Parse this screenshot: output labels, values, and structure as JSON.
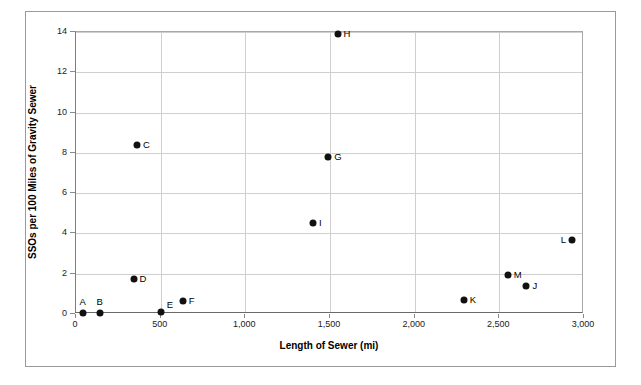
{
  "chart_data": {
    "type": "scatter",
    "title": "",
    "xlabel": "Length of Sewer (mi)",
    "ylabel": "SSOs per 100 Miles of Gravity Sewer",
    "xlim": [
      0,
      3000
    ],
    "ylim": [
      0,
      14
    ],
    "xticks": [
      0,
      500,
      1000,
      1500,
      2000,
      2500,
      3000
    ],
    "xtick_labels": [
      "0",
      "500",
      "1,000",
      "1,500",
      "2,000",
      "2,500",
      "3,000"
    ],
    "yticks": [
      0,
      2,
      4,
      6,
      8,
      10,
      12,
      14
    ],
    "ytick_labels": [
      "0",
      "2",
      "4",
      "6",
      "8",
      "10",
      "12",
      "14"
    ],
    "grid": true,
    "legend": "none",
    "marker": "filled-circle",
    "marker_color": "#111111",
    "grid_color": "#cfcfcf",
    "points": [
      {
        "label": "A",
        "x": 40,
        "y": 0.05,
        "label_pos": "above"
      },
      {
        "label": "B",
        "x": 140,
        "y": 0.05,
        "label_pos": "above"
      },
      {
        "label": "C",
        "x": 360,
        "y": 8.4,
        "label_pos": "right"
      },
      {
        "label": "D",
        "x": 340,
        "y": 1.75,
        "label_pos": "right"
      },
      {
        "label": "E",
        "x": 500,
        "y": 0.1,
        "label_pos": "right-up"
      },
      {
        "label": "F",
        "x": 630,
        "y": 0.65,
        "label_pos": "right"
      },
      {
        "label": "G",
        "x": 1490,
        "y": 7.8,
        "label_pos": "right"
      },
      {
        "label": "H",
        "x": 1545,
        "y": 13.9,
        "label_pos": "right"
      },
      {
        "label": "I",
        "x": 1400,
        "y": 4.5,
        "label_pos": "right"
      },
      {
        "label": "J",
        "x": 2660,
        "y": 1.4,
        "label_pos": "right"
      },
      {
        "label": "K",
        "x": 2290,
        "y": 0.7,
        "label_pos": "right"
      },
      {
        "label": "L",
        "x": 2930,
        "y": 3.65,
        "label_pos": "left"
      },
      {
        "label": "M",
        "x": 2550,
        "y": 1.95,
        "label_pos": "right"
      }
    ]
  }
}
